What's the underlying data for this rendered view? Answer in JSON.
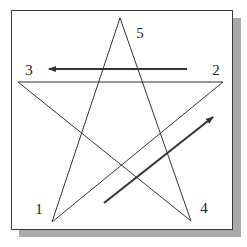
{
  "diagram": {
    "title": "",
    "colors": {
      "frame_border": "#3a3a3a",
      "shadow": "#a9a9a9",
      "star_stroke": "#333333",
      "arrow_stroke": "#333333",
      "label": "#222222",
      "background": "#ffffff"
    },
    "vertices": [
      {
        "id": "1",
        "label": "1",
        "x": 52,
        "y": 222,
        "label_x": 39,
        "label_y": 209
      },
      {
        "id": "2",
        "label": "2",
        "x": 223,
        "y": 82,
        "label_x": 216,
        "label_y": 70
      },
      {
        "id": "3",
        "label": "3",
        "x": 18,
        "y": 82,
        "label_x": 29,
        "label_y": 70
      },
      {
        "id": "4",
        "label": "4",
        "x": 191,
        "y": 221,
        "label_x": 204,
        "label_y": 208
      },
      {
        "id": "5",
        "label": "5",
        "x": 120,
        "y": 18,
        "label_x": 140,
        "label_y": 33
      }
    ],
    "edges": [
      {
        "from": "1",
        "to": "2"
      },
      {
        "from": "2",
        "to": "3"
      },
      {
        "from": "3",
        "to": "4"
      },
      {
        "from": "4",
        "to": "5"
      },
      {
        "from": "5",
        "to": "1"
      }
    ],
    "arrows": [
      {
        "name": "arrow-toward-3",
        "x1": 187,
        "y1": 69,
        "x2": 49,
        "y2": 69
      },
      {
        "name": "arrow-toward-2",
        "x1": 104,
        "y1": 203,
        "x2": 213,
        "y2": 117
      }
    ]
  }
}
